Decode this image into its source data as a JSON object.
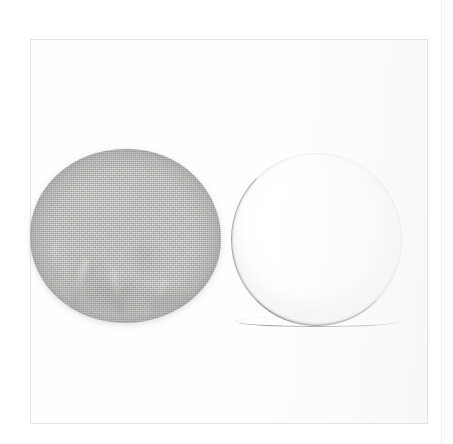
{
  "figure": {
    "caption": "",
    "background_color": "#ffffff",
    "frame": {
      "label": "photo border",
      "color": "#e4e4e4",
      "x": 30,
      "y": 39,
      "width": 398,
      "height": 385
    },
    "artifacts": {
      "scan_line_label": "vertical scan edge line",
      "scan_line_color": "#f0f0f0"
    }
  },
  "samples": [
    {
      "id": "left",
      "name": "gray woven fabric disc",
      "description": "circular textile sample with fine woven weave and wrinkled folds in the lower half",
      "surface": "woven textile",
      "color": "#a9a9a8",
      "shape": "circle",
      "x": 30,
      "y": 149,
      "width": 191,
      "height": 174,
      "label": ""
    },
    {
      "id": "right",
      "name": "white membrane disc",
      "description": "smooth white circular membrane with thin gray rim, darker along the bottom edge",
      "surface": "smooth membrane",
      "color": "#ffffff",
      "rim_color": "#8c8c8c",
      "shape": "circle",
      "x": 232,
      "y": 154,
      "width": 169,
      "height": 171,
      "label": ""
    }
  ]
}
